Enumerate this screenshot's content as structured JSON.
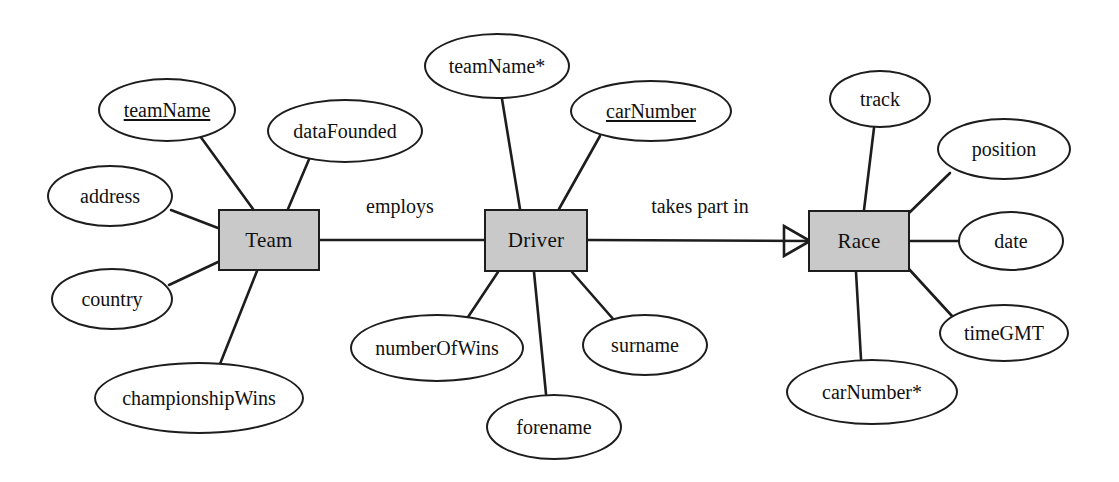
{
  "diagram": {
    "type": "entity-relationship-diagram",
    "notation": "Chen-style with crow's foot",
    "background_color": "#ffffff",
    "entity_fill_color": "#c9c9c9",
    "entity_border_color": "#1d1d1d",
    "attribute_fill_color": "#ffffff",
    "attribute_border_color": "#1d1d1d",
    "line_color": "#1d1d1d"
  },
  "entities": [
    {
      "id": "team",
      "label": "Team",
      "cx": 269,
      "cy": 240,
      "w": 102,
      "h": 62
    },
    {
      "id": "driver",
      "label": "Driver",
      "cx": 536,
      "cy": 240,
      "w": 104,
      "h": 63
    },
    {
      "id": "race",
      "label": "Race",
      "cx": 859,
      "cy": 241,
      "w": 102,
      "h": 62
    }
  ],
  "attributes": [
    {
      "id": "team-teamname",
      "owner": "team",
      "label": "teamName",
      "key": "primary",
      "cx": 167,
      "cy": 110,
      "rx": 69,
      "ry": 32
    },
    {
      "id": "team-datafounded",
      "owner": "team",
      "label": "dataFounded",
      "key": "none",
      "cx": 345,
      "cy": 131,
      "rx": 78,
      "ry": 32
    },
    {
      "id": "team-address",
      "owner": "team",
      "label": "address",
      "key": "none",
      "cx": 110,
      "cy": 196,
      "rx": 63,
      "ry": 31
    },
    {
      "id": "team-country",
      "owner": "team",
      "label": "country",
      "key": "none",
      "cx": 112,
      "cy": 299,
      "rx": 61,
      "ry": 31
    },
    {
      "id": "team-championshipwins",
      "owner": "team",
      "label": "championshipWins",
      "key": "none",
      "cx": 199,
      "cy": 398,
      "rx": 105,
      "ry": 36
    },
    {
      "id": "driver-teamname",
      "owner": "driver",
      "label": "teamName*",
      "key": "foreign",
      "cx": 497,
      "cy": 66,
      "rx": 73,
      "ry": 33
    },
    {
      "id": "driver-carnumber",
      "owner": "driver",
      "label": "carNumber",
      "key": "primary",
      "cx": 651,
      "cy": 111,
      "rx": 81,
      "ry": 31
    },
    {
      "id": "driver-numberofwins",
      "owner": "driver",
      "label": "numberOfWins",
      "key": "none",
      "cx": 437,
      "cy": 348,
      "rx": 87,
      "ry": 34
    },
    {
      "id": "driver-forename",
      "owner": "driver",
      "label": "forename",
      "key": "none",
      "cx": 554,
      "cy": 427,
      "rx": 68,
      "ry": 33
    },
    {
      "id": "driver-surname",
      "owner": "driver",
      "label": "surname",
      "key": "none",
      "cx": 645,
      "cy": 345,
      "rx": 63,
      "ry": 31
    },
    {
      "id": "race-track",
      "owner": "race",
      "label": "track",
      "key": "none",
      "cx": 880,
      "cy": 99,
      "rx": 51,
      "ry": 29
    },
    {
      "id": "race-position",
      "owner": "race",
      "label": "position",
      "key": "none",
      "cx": 1004,
      "cy": 149,
      "rx": 67,
      "ry": 31
    },
    {
      "id": "race-date",
      "owner": "race",
      "label": "date",
      "key": "none",
      "cx": 1011,
      "cy": 241,
      "rx": 53,
      "ry": 30
    },
    {
      "id": "race-timegmt",
      "owner": "race",
      "label": "timeGMT",
      "key": "none",
      "cx": 1004,
      "cy": 333,
      "rx": 65,
      "ry": 29
    },
    {
      "id": "race-carnumber",
      "owner": "race",
      "label": "carNumber*",
      "key": "foreign",
      "cx": 872,
      "cy": 392,
      "rx": 86,
      "ry": 33
    }
  ],
  "relationships": [
    {
      "id": "employs",
      "label": "employs",
      "from": "team",
      "to": "driver",
      "label_x": 400,
      "label_y": 216,
      "cardinality_target": "none"
    },
    {
      "id": "takes-part-in",
      "label": "takes part in",
      "from": "driver",
      "to": "race",
      "label_x": 700,
      "label_y": 216,
      "cardinality_target": "many-crowsfoot"
    }
  ],
  "connector_lines": [
    {
      "from": "team-teamname",
      "x1": 200,
      "y1": 136,
      "x2": 253,
      "y2": 209
    },
    {
      "from": "team-datafounded",
      "x1": 310,
      "y1": 157,
      "x2": 288,
      "y2": 209
    },
    {
      "from": "team-address",
      "x1": 171,
      "y1": 210,
      "x2": 218,
      "y2": 228
    },
    {
      "from": "team-country",
      "x1": 169,
      "y1": 285,
      "x2": 218,
      "y2": 262
    },
    {
      "from": "team-championshipwins",
      "x1": 220,
      "y1": 364,
      "x2": 257,
      "y2": 271
    },
    {
      "from": "driver-teamname",
      "x1": 502,
      "y1": 99,
      "x2": 520,
      "y2": 209
    },
    {
      "from": "driver-carnumber",
      "x1": 600,
      "y1": 136,
      "x2": 559,
      "y2": 209
    },
    {
      "from": "driver-numberofwins",
      "x1": 468,
      "y1": 317,
      "x2": 498,
      "y2": 272
    },
    {
      "from": "driver-forename",
      "x1": 546,
      "y1": 394,
      "x2": 534,
      "y2": 272
    },
    {
      "from": "driver-surname",
      "x1": 614,
      "y1": 320,
      "x2": 572,
      "y2": 272
    },
    {
      "from": "race-track",
      "x1": 874,
      "y1": 128,
      "x2": 864,
      "y2": 210
    },
    {
      "from": "race-position",
      "x1": 950,
      "y1": 173,
      "x2": 909,
      "y2": 213
    },
    {
      "from": "race-date",
      "x1": 958,
      "y1": 241,
      "x2": 910,
      "y2": 241
    },
    {
      "from": "race-timegmt",
      "x1": 952,
      "y1": 316,
      "x2": 908,
      "y2": 268
    },
    {
      "from": "race-carnumber",
      "x1": 861,
      "y1": 359,
      "x2": 856,
      "y2": 272
    }
  ],
  "legend": {
    "primary_key_note": "underlined = primary key",
    "foreign_key_note": "asterisk = foreign key"
  }
}
